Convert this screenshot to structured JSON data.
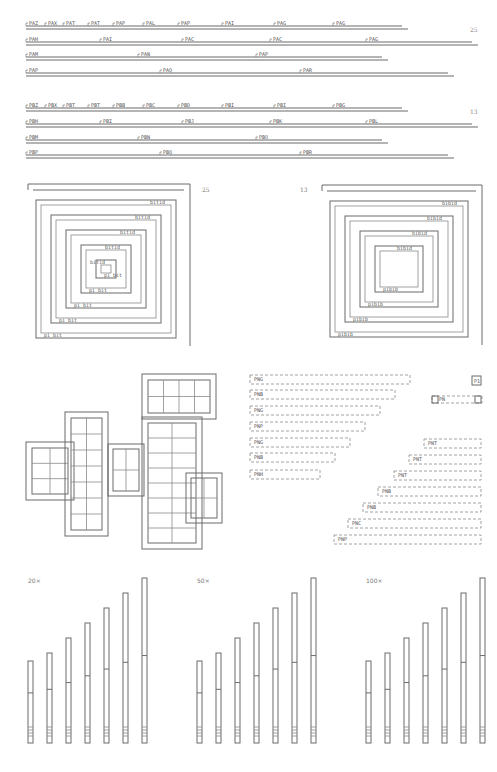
{
  "figure": {
    "panel_a": {
      "page_number": "25",
      "rows": [
        {
          "y": 26,
          "x1": 26,
          "x2": 402,
          "labels": [
            {
              "x": 26,
              "t": "PAZ"
            },
            {
              "x": 45,
              "t": "PAX"
            },
            {
              "x": 63,
              "t": "PAT"
            },
            {
              "x": 88,
              "t": "PAT"
            },
            {
              "x": 113,
              "t": "PAP"
            },
            {
              "x": 143,
              "t": "PAL"
            },
            {
              "x": 178,
              "t": "PAP"
            },
            {
              "x": 222,
              "t": "PAI"
            },
            {
              "x": 274,
              "t": "PAG"
            },
            {
              "x": 333,
              "t": "PAG"
            }
          ]
        },
        {
          "y": 42,
          "x1": 26,
          "x2": 472,
          "labels": [
            {
              "x": 26,
              "t": "PAH"
            },
            {
              "x": 100,
              "t": "PAI"
            },
            {
              "x": 182,
              "t": "PAC"
            },
            {
              "x": 270,
              "t": "PAC"
            },
            {
              "x": 366,
              "t": "PAG"
            }
          ]
        },
        {
          "y": 57,
          "x1": 26,
          "x2": 382,
          "labels": [
            {
              "x": 26,
              "t": "PAM"
            },
            {
              "x": 138,
              "t": "PAN"
            },
            {
              "x": 256,
              "t": "PAP"
            }
          ]
        },
        {
          "y": 73,
          "x1": 26,
          "x2": 448,
          "labels": [
            {
              "x": 26,
              "t": "PAP"
            },
            {
              "x": 160,
              "t": "PAQ"
            },
            {
              "x": 300,
              "t": "PAR"
            }
          ]
        }
      ]
    },
    "panel_b": {
      "page_number": "13",
      "rows": [
        {
          "y": 108,
          "x1": 26,
          "x2": 402,
          "labels": [
            {
              "x": 26,
              "t": "PBZ"
            },
            {
              "x": 45,
              "t": "PBX"
            },
            {
              "x": 63,
              "t": "PBT"
            },
            {
              "x": 88,
              "t": "PBT"
            },
            {
              "x": 113,
              "t": "PBB"
            },
            {
              "x": 143,
              "t": "PBC"
            },
            {
              "x": 178,
              "t": "PBD"
            },
            {
              "x": 222,
              "t": "PBI"
            },
            {
              "x": 274,
              "t": "PBI"
            },
            {
              "x": 333,
              "t": "PBG"
            }
          ]
        },
        {
          "y": 124,
          "x1": 26,
          "x2": 472,
          "labels": [
            {
              "x": 26,
              "t": "PBH"
            },
            {
              "x": 100,
              "t": "PBI"
            },
            {
              "x": 182,
              "t": "PBJ"
            },
            {
              "x": 270,
              "t": "PBK"
            },
            {
              "x": 366,
              "t": "PBL"
            }
          ]
        },
        {
          "y": 140,
          "x1": 26,
          "x2": 382,
          "labels": [
            {
              "x": 26,
              "t": "PBM"
            },
            {
              "x": 138,
              "t": "PBN"
            },
            {
              "x": 256,
              "t": "PBO"
            }
          ]
        },
        {
          "y": 155,
          "x1": 26,
          "x2": 448,
          "labels": [
            {
              "x": 26,
              "t": "PBP"
            },
            {
              "x": 160,
              "t": "PBQ"
            },
            {
              "x": 300,
              "t": "PBR"
            }
          ]
        }
      ]
    },
    "spiral_left": {
      "page_number": "25",
      "cx": 109,
      "cy": 265,
      "labels_top": [
        "bitid",
        "bitid",
        "bitid",
        "bitid",
        "bitid"
      ],
      "labels_bottom": [
        "pi bit",
        "pi bit",
        "pi bit",
        "pi bit",
        "pi bit"
      ]
    },
    "spiral_right": {
      "page_number": "13",
      "cx": 406,
      "cy": 265,
      "labels_top": [
        "bibid",
        "bibid",
        "bibid",
        "bibid",
        "bibid"
      ],
      "labels_bottom": [
        "pibib",
        "pibib",
        "pibib",
        "pibib",
        "pibib"
      ]
    },
    "floorplan": {
      "description": "cross-shaped cell array layout"
    },
    "stagger": {
      "left_boxes": [
        {
          "y": 375,
          "w": 160,
          "t": "PNG"
        },
        {
          "y": 390,
          "w": 145,
          "t": "PNB"
        },
        {
          "y": 406,
          "w": 130,
          "t": "PNG"
        },
        {
          "y": 422,
          "w": 115,
          "t": "PNP"
        },
        {
          "y": 438,
          "w": 100,
          "t": "PNG"
        },
        {
          "y": 453,
          "w": 85,
          "t": "PNB"
        },
        {
          "y": 470,
          "w": 70,
          "t": "PNH"
        }
      ],
      "right_boxes": [
        {
          "y": 439,
          "x": 424,
          "t": "PNT"
        },
        {
          "y": 455,
          "x": 409,
          "t": "PNT"
        },
        {
          "y": 471,
          "x": 394,
          "t": "PNT"
        },
        {
          "y": 487,
          "x": 378,
          "t": "PNB"
        },
        {
          "y": 503,
          "x": 363,
          "t": "PNB"
        },
        {
          "y": 519,
          "x": 348,
          "t": "PNC"
        },
        {
          "y": 535,
          "x": 334,
          "t": "PNP"
        }
      ],
      "small_box_label": "P1",
      "short_box_label": "PN"
    },
    "bar_groups": [
      {
        "label": "20×",
        "x0": 28
      },
      {
        "label": "50×",
        "x0": 197
      },
      {
        "label": "100×",
        "x0": 366
      }
    ]
  },
  "chart_data": {
    "type": "bar",
    "title": "",
    "groups": [
      "20×",
      "50×",
      "100×"
    ],
    "categories": [
      "1",
      "2",
      "3",
      "4",
      "5",
      "6",
      "7"
    ],
    "series": [
      {
        "name": "20×",
        "values": [
          82,
          90,
          105,
          120,
          135,
          150,
          165
        ]
      },
      {
        "name": "50×",
        "values": [
          82,
          90,
          105,
          120,
          135,
          150,
          165
        ]
      },
      {
        "name": "100×",
        "values": [
          82,
          90,
          105,
          120,
          135,
          150,
          165
        ]
      }
    ],
    "xlabel": "",
    "ylabel": ""
  }
}
